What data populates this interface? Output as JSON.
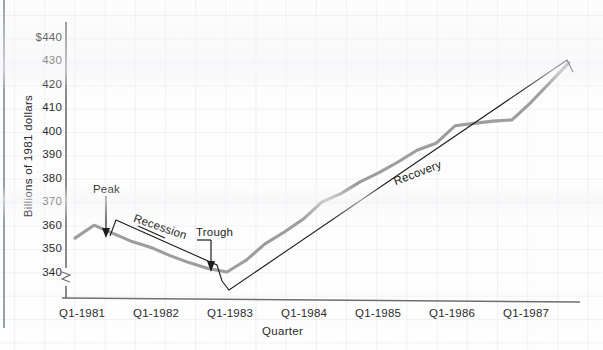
{
  "chart_data": {
    "type": "line",
    "title": "",
    "xlabel": "Quarter",
    "ylabel": "Billions of 1981 dollars",
    "ylim": [
      338,
      442
    ],
    "ytick_labels": [
      "$440",
      "430",
      "420",
      "410",
      "400",
      "390",
      "380",
      "370",
      "360",
      "350",
      "340"
    ],
    "ytick_values": [
      440,
      430,
      420,
      410,
      400,
      390,
      380,
      370,
      360,
      350,
      340
    ],
    "xtick_labels": [
      "Q1-1981",
      "Q1-1982",
      "Q1-1983",
      "Q1-1984",
      "Q1-1985",
      "Q1-1986",
      "Q1-1987"
    ],
    "xtick_values": [
      1981,
      1982,
      1983,
      1984,
      1985,
      1986,
      1987
    ],
    "grid": true,
    "legend": "none",
    "y_axis_break": true,
    "series": [
      {
        "name": "Real GNP",
        "color": "#9d9d9d",
        "x": [
          1981.0,
          1981.25,
          1981.5,
          1981.75,
          1982.0,
          1982.25,
          1982.5,
          1982.75,
          1983.0,
          1983.25,
          1983.5,
          1983.75,
          1984.0,
          1984.25,
          1984.5,
          1984.75,
          1985.0,
          1985.25,
          1985.5,
          1985.75,
          1986.0,
          1986.25,
          1986.5,
          1986.75,
          1987.0,
          1987.25,
          1987.5
        ],
        "values": [
          354.5,
          360.0,
          356.5,
          353.0,
          350.5,
          347.0,
          344.0,
          341.5,
          340.0,
          345.0,
          352.0,
          357.0,
          362.5,
          370.0,
          373.5,
          378.5,
          382.5,
          387.0,
          392.0,
          395.0,
          402.5,
          403.5,
          404.5,
          405.0,
          412.5,
          421.0,
          429.5
        ]
      }
    ],
    "annotations": [
      {
        "name": "peak",
        "label": "Peak",
        "x": 1981.25,
        "y": 360.0,
        "type": "arrow-down"
      },
      {
        "name": "trough",
        "label": "Trough",
        "x": 1983.0,
        "y": 340.0,
        "type": "arrow-down"
      },
      {
        "name": "recession",
        "label": "Recession",
        "from_x": 1981.25,
        "to_x": 1983.0,
        "type": "bracket"
      },
      {
        "name": "recovery",
        "label": "Recovery",
        "from_x": 1983.0,
        "to_x": 1987.5,
        "type": "bracket"
      }
    ]
  },
  "axis": {
    "y_label": "Billions of 1981 dollars",
    "x_label": "Quarter",
    "y_ticks": [
      "$440",
      "430",
      "420",
      "410",
      "400",
      "390",
      "380",
      "370",
      "360",
      "350",
      "340"
    ],
    "x_ticks": [
      "Q1-1981",
      "Q1-1982",
      "Q1-1983",
      "Q1-1984",
      "Q1-1985",
      "Q1-1986",
      "Q1-1987"
    ]
  },
  "annotations": {
    "peak": "Peak",
    "trough": "Trough",
    "recession": "Recession",
    "recovery": "Recovery"
  },
  "colors": {
    "series_line": "#9d9d9d",
    "annotation_line": "#3a3a3a",
    "axis": "#6e6e6e",
    "grid": "#c8ccd8",
    "text": "#2b2b2b",
    "background": "#fdfdfd"
  }
}
